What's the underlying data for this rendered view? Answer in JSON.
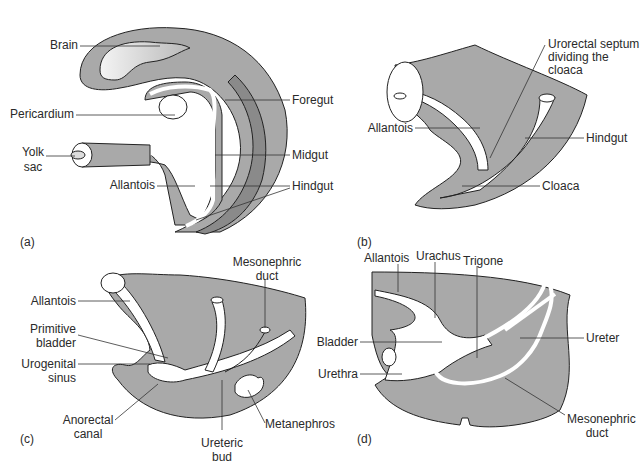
{
  "figure": {
    "fill_color": "#a9a9a9",
    "dark_band_color": "#8a8a8a",
    "outline_color": "#222222",
    "panels": [
      {
        "tag": "(a)",
        "labels": {
          "brain": "Brain",
          "pericardium": "Pericardium",
          "yolk_sac_line1": "Yolk",
          "yolk_sac_line2": "sac",
          "allantois": "Allantois",
          "foregut": "Foregut",
          "midgut": "Midgut",
          "hindgut": "Hindgut"
        }
      },
      {
        "tag": "(b)",
        "labels": {
          "urorectal_line1": "Urorectal septum",
          "urorectal_line2": "dividing the",
          "urorectal_line3": "cloaca",
          "allantois": "Allantois",
          "hindgut": "Hindgut",
          "cloaca": "Cloaca"
        }
      },
      {
        "tag": "(c)",
        "labels": {
          "allantois": "Allantois",
          "primitive_bladder_line1": "Primitive",
          "primitive_bladder_line2": "bladder",
          "urogenital_sinus_line1": "Urogenital",
          "urogenital_sinus_line2": "sinus",
          "anorectal_canal_line1": "Anorectal",
          "anorectal_canal_line2": "canal",
          "mesonephric_duct_line1": "Mesonephric",
          "mesonephric_duct_line2": "duct",
          "ureteric_bud_line1": "Ureteric",
          "ureteric_bud_line2": "bud",
          "metanephros": "Metanephros"
        }
      },
      {
        "tag": "(d)",
        "labels": {
          "allantois": "Allantois",
          "urachus": "Urachus",
          "trigone": "Trigone",
          "bladder": "Bladder",
          "urethra": "Urethra",
          "ureter": "Ureter",
          "mesonephric_duct_line1": "Mesonephric",
          "mesonephric_duct_line2": "duct"
        }
      }
    ]
  }
}
